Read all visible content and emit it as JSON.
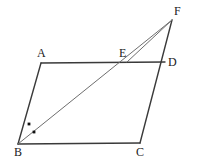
{
  "figure": {
    "canvas": {
      "width": 198,
      "height": 160,
      "background": "#ffffff"
    },
    "colors": {
      "solid_stroke": "#3a3a3a",
      "thin_stroke": "#6e6e6e",
      "label_text": "#1a1a1a",
      "angle_mark": "#111111"
    },
    "points": {
      "A": {
        "label": "A",
        "x": 41,
        "y": 63,
        "label_x": 37,
        "label_y": 47
      },
      "B": {
        "label": "B",
        "x": 18,
        "y": 144,
        "label_x": 14,
        "label_y": 146
      },
      "C": {
        "label": "C",
        "x": 140,
        "y": 143,
        "label_x": 136,
        "label_y": 146
      },
      "D": {
        "label": "D",
        "x": 165,
        "y": 62,
        "label_x": 168,
        "label_y": 56
      },
      "E": {
        "label": "E",
        "x": 127,
        "y": 62,
        "label_x": 119,
        "label_y": 47
      },
      "F": {
        "label": "F",
        "x": 172,
        "y": 20,
        "label_x": 174,
        "label_y": 5
      }
    },
    "segments": [
      {
        "name": "segment-AD",
        "from": "A",
        "to": "D",
        "weight": "solid"
      },
      {
        "name": "segment-AB",
        "from": "A",
        "to": "B",
        "weight": "solid"
      },
      {
        "name": "segment-BC",
        "from": "B",
        "to": "C",
        "weight": "solid"
      },
      {
        "name": "segment-CF",
        "from": "C",
        "to": "F",
        "weight": "solid"
      },
      {
        "name": "segment-BF",
        "from": "B",
        "to": "F",
        "weight": "thin"
      },
      {
        "name": "segment-EF",
        "from": "E",
        "to": "F",
        "weight": "thin"
      }
    ],
    "angle_marks": [
      {
        "name": "angle-mark-abe",
        "x": 29,
        "y": 124
      },
      {
        "name": "angle-mark-ebc",
        "x": 34,
        "y": 132
      }
    ]
  }
}
